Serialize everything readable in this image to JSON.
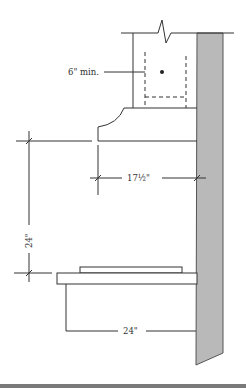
{
  "diagram": {
    "labels": {
      "flue_min": "6\" min.",
      "hood_depth": "17½\"",
      "hood_height": "24\"",
      "range_depth": "24\""
    },
    "colors": {
      "line": "#333333",
      "wall_fill": "#b9b9b9",
      "wall_stroke": "#555555",
      "bottom_band": "#7a7a7a"
    },
    "components": {
      "wall": "wall-section",
      "flue": "flue-duct",
      "hood": "range-hood",
      "range": "cooktop-range",
      "cabinet": "base-cabinet"
    }
  }
}
